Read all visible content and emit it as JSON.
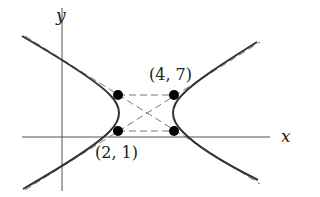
{
  "diagram": {
    "type": "hyperbola-with-asymptotes",
    "axes": {
      "x_label": "x",
      "y_label": "y"
    },
    "points": [
      {
        "id": "p1",
        "label": "(2, 1)",
        "labeled": true
      },
      {
        "id": "p2",
        "label": "(4, 7)",
        "labeled": true
      },
      {
        "id": "p3",
        "label": "",
        "labeled": false
      },
      {
        "id": "p4",
        "label": "",
        "labeled": false
      }
    ],
    "elements": [
      "hyperbola-left-branch",
      "hyperbola-right-branch",
      "asymptote-1",
      "asymptote-2",
      "dashed-rectangle",
      "dashed-diagonals"
    ],
    "colors": {
      "curve": "#333333",
      "axis": "#555555",
      "dashed": "#777777",
      "point": "#000000"
    }
  }
}
